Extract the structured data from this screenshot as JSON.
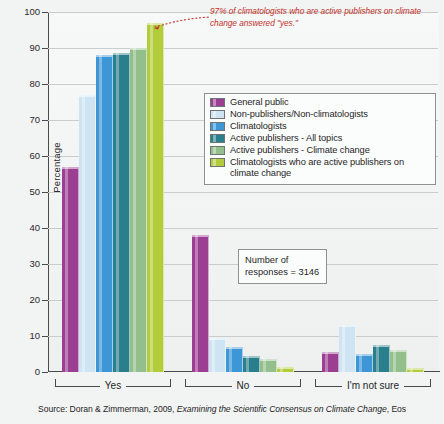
{
  "chart_data": {
    "type": "bar",
    "title": "",
    "xlabel": "",
    "ylabel": "Percentage",
    "ylim": [
      0,
      100
    ],
    "ytick_step": 10,
    "yticks": [
      0,
      10,
      20,
      30,
      40,
      50,
      60,
      70,
      80,
      90,
      100
    ],
    "grid": true,
    "legend_position": "inside-upper-right",
    "categories": [
      "Yes",
      "No",
      "I'm not sure"
    ],
    "series": [
      {
        "name": "General public",
        "color": "#9c3f93",
        "values": [
          57,
          38,
          5.5
        ]
      },
      {
        "name": "Non-publishers/Non-climatologists",
        "color": "#cfe4f3",
        "values": [
          77,
          9.5,
          13
        ]
      },
      {
        "name": "Climatologists",
        "color": "#3d96d6",
        "values": [
          88,
          7,
          5
        ]
      },
      {
        "name": "Active publishers - All topics",
        "color": "#2a7f8c",
        "values": [
          88.5,
          4.5,
          7.5
        ]
      },
      {
        "name": "Active publishers - Climate change",
        "color": "#92bf8b",
        "values": [
          90,
          3.5,
          6
        ]
      },
      {
        "name": "Climatologists who are active publishers on climate change",
        "color": "#b3cc3c",
        "values": [
          97,
          1.5,
          1
        ]
      }
    ]
  },
  "annotation": {
    "text": "97% of climatologists who are active publishers on climate change answered \"yes.\"",
    "color": "#c4342c"
  },
  "responses_box": {
    "line1": "Number of",
    "line2": "responses = 3146"
  },
  "source": {
    "prefix": "Source: Doran & Zimmerman, 2009, ",
    "italic": "Examining the Scientific Consensus on Climate Change",
    "suffix": ", Eos"
  }
}
